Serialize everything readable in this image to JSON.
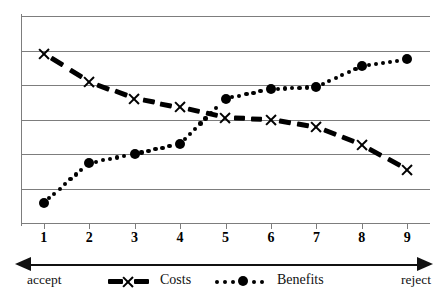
{
  "chart_data": {
    "type": "line",
    "title": "",
    "xlabel": "",
    "ylabel": "",
    "x": [
      1,
      2,
      3,
      4,
      5,
      6,
      7,
      8,
      9
    ],
    "categories": [
      "1",
      "2",
      "3",
      "4",
      "5",
      "6",
      "7",
      "8",
      "9"
    ],
    "xtick_labels": [
      "1",
      "2",
      "3",
      "4",
      "5",
      "6",
      "7",
      "8",
      "9"
    ],
    "ylim": [
      0,
      6
    ],
    "xlim": [
      0.5,
      9.5
    ],
    "yticks": [
      0,
      1,
      2,
      3,
      4,
      5,
      6
    ],
    "ytick_labels": [],
    "grid": "horizontal",
    "legend_position": "bottom",
    "series": [
      {
        "name": "Costs",
        "marker": "x",
        "linestyle": "dashed",
        "color": "#000000",
        "values": [
          4.9,
          4.1,
          3.6,
          3.35,
          3.05,
          3.0,
          2.78,
          2.27,
          1.55
        ]
      },
      {
        "name": "Benefits",
        "marker": "filled-circle",
        "linestyle": "dotted",
        "color": "#000000",
        "values": [
          0.58,
          1.74,
          2.0,
          2.3,
          3.6,
          3.88,
          3.94,
          4.55,
          4.75
        ]
      }
    ],
    "annotations": {
      "axis_left": "accept",
      "axis_right": "reject",
      "axis_arrow": "double-headed"
    }
  },
  "legend": {
    "items": [
      {
        "label": "Costs",
        "marker": "x-dashed-marker"
      },
      {
        "label": "Benefits",
        "marker": "circle-dotted-marker"
      }
    ]
  },
  "axis": {
    "left_label": "accept",
    "right_label": "reject"
  },
  "colors": {
    "grid": "#7d7d7d",
    "ink": "#000000"
  }
}
